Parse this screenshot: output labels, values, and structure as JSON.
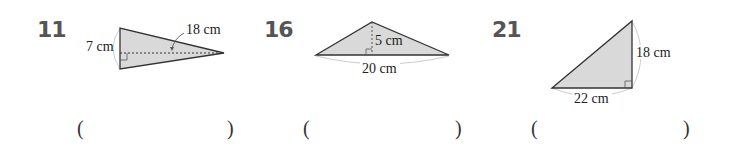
{
  "problems": [
    {
      "number": "11",
      "labels": {
        "height": "7 cm",
        "base": "18 cm"
      },
      "answer_open": "(",
      "answer_close": ")"
    },
    {
      "number": "16",
      "labels": {
        "height": "5 cm",
        "base": "20 cm"
      },
      "answer_open": "(",
      "answer_close": ")"
    },
    {
      "number": "21",
      "labels": {
        "height": "18 cm",
        "base": "22 cm"
      },
      "answer_open": "(",
      "answer_close": ")"
    }
  ],
  "colors": {
    "fill": "#d9d9d9",
    "stroke": "#333333",
    "number": "#555555",
    "arc": "#cccccc"
  }
}
